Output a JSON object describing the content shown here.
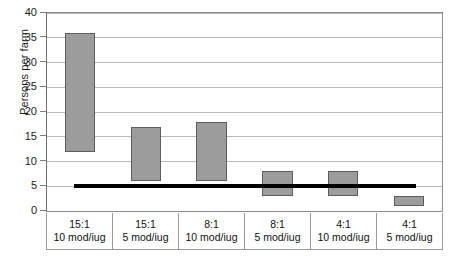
{
  "chart_data": {
    "type": "bar",
    "orientation": "vertical",
    "bar_style": "floating-range",
    "title": "",
    "xlabel": "",
    "ylabel": "Persons per farm",
    "ylim": [
      0,
      40
    ],
    "ytick_step": 5,
    "yticks": [
      0,
      5,
      10,
      15,
      20,
      25,
      30,
      35,
      40
    ],
    "ytick_labels": [
      "0",
      "5",
      "10",
      "15",
      "20",
      "25",
      "30",
      "35",
      "40"
    ],
    "grid": "horizontal",
    "legend": "none",
    "categories": [
      "15:1\n10 mod/iug",
      "15:1\n5 mod/iug",
      "8:1\n10 mod/iug",
      "8:1\n5 mod/iug",
      "4:1\n10 mod/iug",
      "4:1\n5 mod/iug"
    ],
    "category_lines": [
      {
        "line1": "15:1",
        "line2": "10 mod/iug"
      },
      {
        "line1": "15:1",
        "line2": "5 mod/iug"
      },
      {
        "line1": "8:1",
        "line2": "10 mod/iug"
      },
      {
        "line1": "8:1",
        "line2": "5 mod/iug"
      },
      {
        "line1": "4:1",
        "line2": "10 mod/iug"
      },
      {
        "line1": "4:1",
        "line2": "5 mod/iug"
      }
    ],
    "series": [
      {
        "name": "Persons per farm range",
        "low": [
          12,
          6,
          6,
          3,
          3,
          1
        ],
        "high": [
          36,
          17,
          18,
          8,
          8,
          3
        ],
        "color": "#9c9c9c",
        "edge_color": "#5d5d5d"
      }
    ],
    "annotations": [
      {
        "type": "reference-line",
        "label": "",
        "value": 5,
        "orientation": "horizontal",
        "color": "#000000",
        "x_start_category_index": 0,
        "x_end_category_index": 5
      }
    ]
  },
  "colors": {
    "bar_fill": "#9c9c9c",
    "bar_edge": "#5d5d5d",
    "grid": "#b9b9b9",
    "axis": "#8d8d8d",
    "reference_line": "#000000",
    "text": "#111111",
    "background": "#ffffff"
  }
}
